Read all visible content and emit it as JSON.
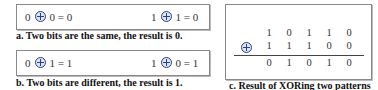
{
  "panel_a": {
    "eq1": {
      "left": "0",
      "right": "0",
      "result": "0"
    },
    "eq2": {
      "left": "1",
      "right": "1",
      "result": "0"
    },
    "caption": "a. Two bits are the same, the result is 0."
  },
  "panel_b": {
    "eq1": {
      "left": "0",
      "right": "1",
      "result": "1"
    },
    "eq2": {
      "left": "1",
      "right": "0",
      "result": "1"
    },
    "caption": "b. Two bits are different, the result is 1."
  },
  "panel_c": {
    "row1": [
      "1",
      "0",
      "1",
      "1",
      "0"
    ],
    "row2": [
      "1",
      "1",
      "1",
      "0",
      "0"
    ],
    "result": [
      "0",
      "1",
      "0",
      "1",
      "0"
    ],
    "caption": "c. Result of XORing two patterns"
  },
  "symbols": {
    "equals": "=",
    "operator": "xor-circle-plus"
  }
}
